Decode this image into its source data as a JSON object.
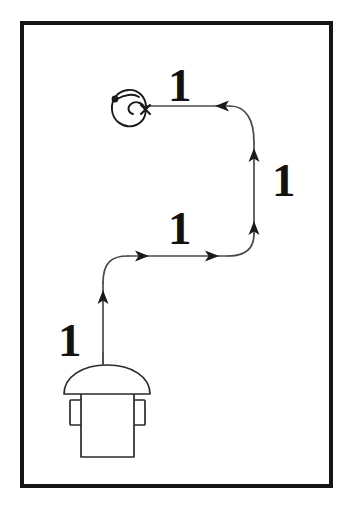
{
  "diagram": {
    "background_color": "#ffffff",
    "frame": {
      "name": "outer-frame",
      "stroke_color": "#151515",
      "stroke_width": 4,
      "x": 20,
      "y": 21,
      "width": 313,
      "height": 467
    },
    "segment_labels": [
      {
        "id": "top",
        "text": "1",
        "x": 168,
        "y": 62,
        "describes": "top horizontal leg, travel right-to-left"
      },
      {
        "id": "right",
        "text": "1",
        "x": 272,
        "y": 157,
        "describes": "right vertical leg, travel upward"
      },
      {
        "id": "middle",
        "text": "1",
        "x": 168,
        "y": 205,
        "describes": "middle horizontal leg, travel left-to-right"
      },
      {
        "id": "bottom",
        "text": "1",
        "x": 58,
        "y": 317,
        "describes": "lower vertical leg, travel upward"
      }
    ],
    "path": {
      "stroke_color": "#4a4a4a",
      "stroke_width": 1.6,
      "arrow_color": "#1a1a1a",
      "arrow_count": 6,
      "arrows": [
        {
          "id": "arrow-bottom-up",
          "x": 102,
          "y": 298,
          "direction": "up"
        },
        {
          "id": "arrow-middle-right-1",
          "x": 142,
          "y": 256,
          "direction": "right"
        },
        {
          "id": "arrow-middle-right-2",
          "x": 212,
          "y": 256,
          "direction": "right"
        },
        {
          "id": "arrow-right-up-1",
          "x": 254,
          "y": 228,
          "direction": "up"
        },
        {
          "id": "arrow-right-up-2",
          "x": 254,
          "y": 155,
          "direction": "up"
        },
        {
          "id": "arrow-top-left",
          "x": 222,
          "y": 106,
          "direction": "left"
        }
      ]
    },
    "spiral": {
      "name": "spiral-terminus",
      "center_x": 132,
      "center_y": 112,
      "start_dot": {
        "x": 115,
        "y": 99,
        "radius": 3.2,
        "color": "#1a1a1a"
      },
      "cross_marker": {
        "x": 145,
        "y": 110,
        "size": 6,
        "color": "#1a1a1a"
      },
      "stroke_color": "#1a1a1a",
      "turns": 2
    },
    "robot": {
      "name": "robot-figure",
      "stroke_color": "#2a2a2a",
      "fill_color": "#ffffff",
      "cap": {
        "cx": 107,
        "cy": 385,
        "rx": 43,
        "ry": 22
      },
      "body": {
        "x": 81,
        "y": 388,
        "width": 52,
        "height": 68
      },
      "left_arm": {
        "x": 70,
        "y": 400,
        "width": 12,
        "height": 24
      },
      "right_arm": {
        "x": 133,
        "y": 400,
        "width": 12,
        "height": 24
      },
      "stem": {
        "x": 103,
        "y": 300,
        "height": 65
      }
    }
  }
}
